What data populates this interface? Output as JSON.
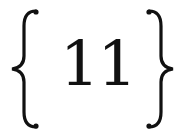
{
  "expression": {
    "open_delimiter": "{",
    "content": "11",
    "close_delimiter": "}"
  },
  "colors": {
    "ink": "#111111",
    "background": "#ffffff"
  }
}
